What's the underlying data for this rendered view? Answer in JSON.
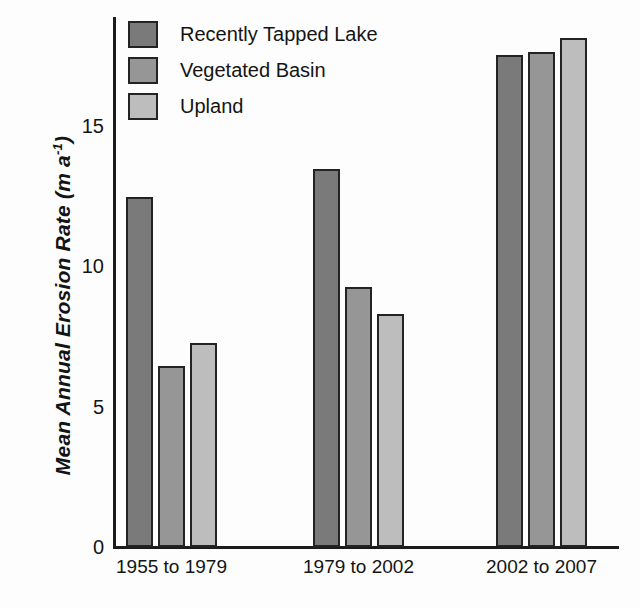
{
  "chart_data": {
    "type": "bar",
    "title": "",
    "xlabel": "",
    "ylabel": "Mean Annual Erosion Rate (m a-1)",
    "ylabel_main": "Mean Annual Erosion Rate (m a",
    "ylabel_sup": "-1",
    "ylabel_tail": ")",
    "ylim": [
      0,
      19
    ],
    "yticks": [
      0,
      5,
      10,
      15
    ],
    "ytick_labels": [
      "0",
      "5",
      "10",
      "15"
    ],
    "grid": false,
    "legend_position": "top-left",
    "categories": [
      "1955 to 1979",
      "1979 to 2002",
      "2002 to 2007"
    ],
    "series": [
      {
        "name": "Recently Tapped Lake",
        "color": "#7a7a7a",
        "values": [
          12.45,
          13.45,
          17.5
        ]
      },
      {
        "name": "Vegetated Basin",
        "color": "#969696",
        "values": [
          6.45,
          9.25,
          17.6
        ]
      },
      {
        "name": "Upland",
        "color": "#bdbdbd",
        "values": [
          7.25,
          8.3,
          18.1
        ]
      }
    ]
  },
  "legend": {
    "items": [
      {
        "label": "Recently Tapped Lake",
        "color": "#7a7a7a"
      },
      {
        "label": "Vegetated Basin",
        "color": "#969696"
      },
      {
        "label": "Upland",
        "color": "#bdbdbd"
      }
    ]
  },
  "axis": {
    "line_color": "#1c1c1c"
  }
}
